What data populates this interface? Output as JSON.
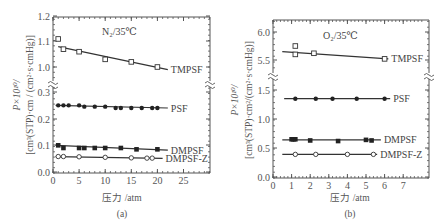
{
  "chart_data": [
    {
      "type": "line",
      "panel_label": "(a)",
      "title": "N₂/35℃",
      "xlabel": "压力 /atm",
      "ylabel_line1": "P×10¹⁰/",
      "ylabel_line2": "[cm³(STP)·cm / (cm²·s·cmHg)]",
      "xlim": [
        0,
        30
      ],
      "xticks": [
        "0",
        "5",
        "10",
        "15",
        "20",
        "25"
      ],
      "ylim_lower": [
        0.0,
        0.3
      ],
      "ylim_upper": [
        1.0,
        1.2
      ],
      "yticks": [
        "0.0",
        "0.1",
        "0.2",
        "0.3",
        "1.0",
        "1.1",
        "1.2"
      ],
      "axis_break": true,
      "series": [
        {
          "name": "TMPSF",
          "marker": "open-square",
          "x": [
            1,
            2,
            5,
            10,
            15,
            20
          ],
          "y": [
            1.11,
            1.07,
            1.06,
            1.03,
            1.02,
            1.0
          ],
          "fit": [
            [
              1,
              1.08
            ],
            [
              22,
              0.99
            ]
          ]
        },
        {
          "name": "PSF",
          "marker": "filled-circle",
          "x": [
            1,
            2,
            3,
            5,
            6,
            8,
            10,
            12,
            13,
            15,
            17,
            19,
            20
          ],
          "y": [
            0.25,
            0.25,
            0.25,
            0.25,
            0.245,
            0.245,
            0.245,
            0.24,
            0.24,
            0.24,
            0.24,
            0.24,
            0.24
          ],
          "fit": [
            [
              0.5,
              0.25
            ],
            [
              22,
              0.24
            ]
          ]
        },
        {
          "name": "DMPSF",
          "marker": "filled-square",
          "x": [
            1,
            2,
            5,
            6,
            8,
            10,
            13,
            16,
            20
          ],
          "y": [
            0.1,
            0.09,
            0.09,
            0.09,
            0.09,
            0.09,
            0.09,
            0.085,
            0.085
          ],
          "fit": [
            [
              0.5,
              0.1
            ],
            [
              22,
              0.082
            ]
          ]
        },
        {
          "name": "DMPSF-Z",
          "marker": "open-circle",
          "x": [
            1,
            2,
            5,
            10,
            15,
            18,
            19
          ],
          "y": [
            0.058,
            0.058,
            0.057,
            0.055,
            0.053,
            0.052,
            0.052
          ],
          "fit": [
            [
              0.5,
              0.058
            ],
            [
              21,
              0.051
            ]
          ]
        }
      ]
    },
    {
      "type": "line",
      "panel_label": "(b)",
      "title": "O₂/35℃",
      "xlabel": "压力 /atm",
      "ylabel_line1": "P×10¹⁰/",
      "ylabel_line2": "[cm³(STP)·cm²/(cm²·s·cmHg)]",
      "xlim": [
        0,
        8
      ],
      "xticks": [
        "0",
        "1",
        "2",
        "3",
        "4",
        "5",
        "6",
        "7"
      ],
      "ylim_lower": [
        0.0,
        1.5
      ],
      "ylim_upper": [
        5.5,
        6.0
      ],
      "yticks": [
        "0.0",
        "0.5",
        "1.0",
        "1.5",
        "5.5",
        "6.0"
      ],
      "axis_break": true,
      "series": [
        {
          "name": "TMPSF",
          "marker": "open-square",
          "x": [
            1.2,
            1.2,
            2.2,
            6.0
          ],
          "y": [
            5.75,
            5.6,
            5.62,
            5.52
          ],
          "fit": [
            [
              0.5,
              5.65
            ],
            [
              6.2,
              5.52
            ]
          ]
        },
        {
          "name": "PSF",
          "marker": "filled-circle",
          "x": [
            1.2,
            2.3,
            3.2,
            4.5,
            6.0
          ],
          "y": [
            1.35,
            1.35,
            1.35,
            1.35,
            1.35
          ],
          "fit": [
            [
              0.6,
              1.35
            ],
            [
              6.3,
              1.35
            ]
          ]
        },
        {
          "name": "DMPSF",
          "marker": "filled-square",
          "x": [
            1.0,
            1.1,
            1.2,
            2.0,
            3.5,
            5.0,
            5.3
          ],
          "y": [
            0.65,
            0.65,
            0.65,
            0.63,
            0.62,
            0.64,
            0.63
          ],
          "fit": [
            [
              0.5,
              0.64
            ],
            [
              5.8,
              0.64
            ]
          ]
        },
        {
          "name": "DMPSF-Z",
          "marker": "open-circle",
          "x": [
            1.2,
            2.3,
            4.0,
            5.4
          ],
          "y": [
            0.39,
            0.39,
            0.39,
            0.39
          ],
          "fit": [
            [
              0.5,
              0.39
            ],
            [
              5.6,
              0.39
            ]
          ]
        }
      ]
    }
  ]
}
